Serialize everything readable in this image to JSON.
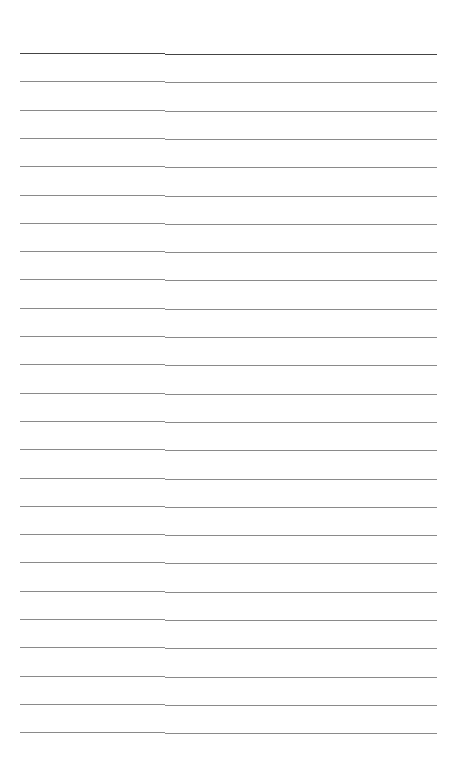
{
  "page": {
    "type": "blank-ruled-sheet",
    "background": "#ffffff",
    "line_count": 25,
    "first_line_y": 53,
    "line_spacing": 28.3,
    "column_split_x": 165,
    "colors": {
      "first_line": "#444444",
      "other_lines": "#8a8a8a"
    }
  }
}
